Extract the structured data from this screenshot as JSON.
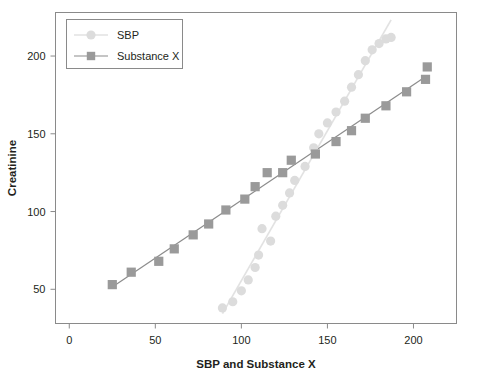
{
  "chart_data": {
    "type": "scatter",
    "title": "",
    "xlabel": "SBP and Substance X",
    "ylabel": "Creatinine",
    "xlim": [
      -8,
      225
    ],
    "ylim": [
      28,
      228
    ],
    "xticks": [
      0,
      50,
      100,
      150,
      200
    ],
    "yticks": [
      50,
      100,
      150,
      200
    ],
    "xtick_labels": [
      "0",
      "50",
      "100",
      "150",
      "200"
    ],
    "ytick_labels": [
      "50",
      "100",
      "150",
      "200"
    ],
    "grid": false,
    "legend_position": "upper left",
    "frame": true,
    "series": [
      {
        "name": "SBP",
        "marker": "circle",
        "color": "#dcdcdc",
        "line_color": "#e2e2e2",
        "trendline": true,
        "x": [
          89,
          95,
          100,
          104,
          108,
          110,
          112,
          117,
          120,
          124,
          128,
          131,
          137,
          142,
          145,
          150,
          155,
          160,
          164,
          168,
          172,
          176,
          180,
          184,
          187
        ],
        "y": [
          38,
          42,
          49,
          56,
          64,
          72,
          89,
          81,
          97,
          104,
          112,
          120,
          129,
          141,
          150,
          157,
          164,
          171,
          180,
          188,
          197,
          204,
          208,
          211,
          212
        ]
      },
      {
        "name": "Substance X",
        "marker": "square",
        "color": "#9a9a9a",
        "line_color": "#8c8c8c",
        "trendline": true,
        "x": [
          25,
          36,
          52,
          61,
          72,
          81,
          91,
          102,
          108,
          115,
          124,
          129,
          143,
          155,
          164,
          172,
          184,
          196,
          207,
          208
        ],
        "y": [
          53,
          61,
          68,
          76,
          85,
          92,
          101,
          108,
          116,
          125,
          125,
          133,
          137,
          145,
          152,
          160,
          168,
          177,
          185,
          193
        ]
      }
    ]
  },
  "legend": {
    "entries": [
      {
        "label": "SBP",
        "marker": "circle-marker",
        "swatch_color": "#dcdcdc"
      },
      {
        "label": "Substance X",
        "marker": "square-marker",
        "swatch_color": "#9a9a9a"
      }
    ]
  }
}
